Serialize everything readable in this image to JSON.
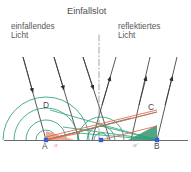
{
  "figure": {
    "title": "Einfallslot",
    "width": 191,
    "height": 172
  },
  "labels": {
    "incident_line1": "einfallendes",
    "incident_line2": "Licht",
    "reflected_line1": "reflektiertes",
    "reflected_line2": "Licht",
    "point_A": "A",
    "point_B": "B",
    "point_C": "C",
    "point_D": "D",
    "angle_incidence": "α",
    "angle_reflection": "α'"
  },
  "colors": {
    "ray": "#3a3a3a",
    "wavefront_green": "#2e9e78",
    "wavefront_teal": "#3aa08a",
    "ray_red": "#e8614a",
    "fill_orange": "#f0a48c",
    "fill_green": "#3f9e7c",
    "normal_line": "#8d8d90",
    "baseline": "#6b6b6d",
    "point_marker": "#3a5fcd",
    "text": "#58585a",
    "background": "#ffffff"
  },
  "geometry": {
    "baseline_y": 140,
    "points": [
      {
        "name": "A",
        "x": 46,
        "y": 140
      },
      {
        "name": "M",
        "x": 101,
        "y": 140
      },
      {
        "name": "B",
        "x": 157,
        "y": 140
      },
      {
        "name": "C",
        "x": 157,
        "y": 112
      },
      {
        "name": "D",
        "x": 50,
        "y": 110
      }
    ],
    "normal_x": 99,
    "incident_rays": 3,
    "reflected_rays": 3,
    "wavefront_arc_radii": [
      46,
      34,
      22,
      11
    ]
  }
}
